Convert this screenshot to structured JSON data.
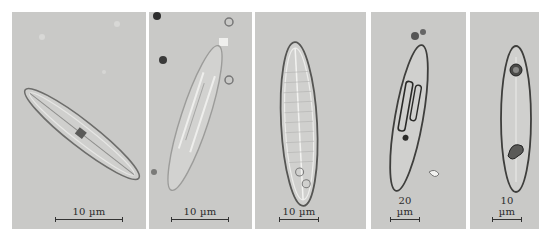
{
  "figure": {
    "background_color": "#ffffff",
    "panel_color": "#c9c9c7",
    "panels": [
      {
        "id": "a",
        "scale_label": "10 µm",
        "subject": "diatom-cell-diagonal"
      },
      {
        "id": "b",
        "scale_label": "10 µm",
        "subject": "diatom-cell-tilted"
      },
      {
        "id": "c",
        "scale_label": "10 µm",
        "subject": "diatom-cell-striated"
      },
      {
        "id": "d",
        "scale_label": "20 µm",
        "subject": "diatom-cell-with-chloroplasts"
      },
      {
        "id": "e",
        "scale_label": "10 µm",
        "subject": "diatom-cell-with-oil-droplet"
      }
    ]
  }
}
